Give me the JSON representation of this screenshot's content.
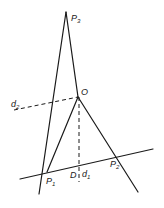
{
  "diagram": {
    "colors": {
      "ink": "#1a1a1a",
      "background": "#ffffff"
    },
    "points": {
      "P3": {
        "label": "P",
        "sub": "3"
      },
      "O": {
        "label": "O"
      },
      "P1": {
        "label": "P",
        "sub": "1"
      },
      "P2": {
        "label": "P",
        "sub": "2"
      },
      "D": {
        "label": "D"
      }
    },
    "lines": {
      "d1": {
        "label": "d",
        "sub": "1"
      },
      "d2": {
        "label": "d",
        "sub": "2"
      }
    }
  }
}
